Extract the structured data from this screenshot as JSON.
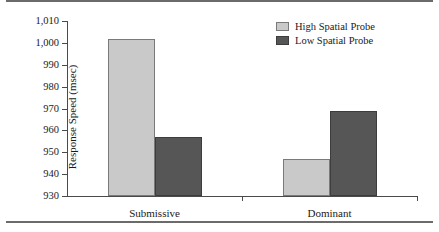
{
  "chart_data": {
    "type": "bar",
    "title": "",
    "xlabel": "",
    "ylabel": "Response Speed (msec)",
    "categories": [
      "Submissive",
      "Dominant"
    ],
    "series": [
      {
        "name": "High Spatial Probe",
        "values": [
          1002,
          947
        ],
        "color": "#c9c9c9"
      },
      {
        "name": "Low Spatial Probe",
        "values": [
          957,
          969
        ],
        "color": "#565656"
      }
    ],
    "ylim": [
      930,
      1010
    ],
    "ytick_labels": [
      "1,010",
      "1,000",
      "990",
      "980",
      "970",
      "960",
      "950",
      "940",
      "930"
    ],
    "ytick_values": [
      1010,
      1000,
      990,
      980,
      970,
      960,
      950,
      940,
      930
    ],
    "grid": false,
    "legend_position": "top-right"
  },
  "legend": {
    "items": [
      {
        "label": "High Spatial Probe"
      },
      {
        "label": "Low Spatial Probe"
      }
    ]
  }
}
